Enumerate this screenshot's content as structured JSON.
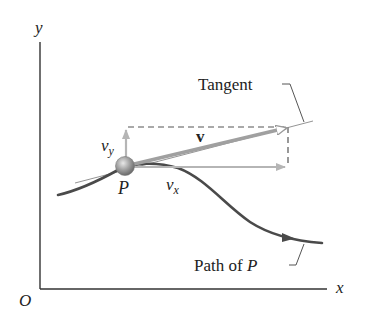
{
  "diagram": {
    "axes": {
      "x_label": "x",
      "y_label": "y",
      "origin_label": "O"
    },
    "particle": {
      "label": "P"
    },
    "vectors": {
      "v_label": "v",
      "vx_label_main": "v",
      "vx_label_sub": "x",
      "vy_label_main": "v",
      "vy_label_sub": "y"
    },
    "callouts": {
      "tangent": "Tangent",
      "path_prefix": "Path of ",
      "path_var": "P"
    },
    "colors": {
      "axis": "#333333",
      "path": "#4a4a4a",
      "vector": "#a8a8a8",
      "dashed": "#555555",
      "particle": "#9a9a9a",
      "tangent_line": "#888888",
      "text": "#222222"
    }
  }
}
